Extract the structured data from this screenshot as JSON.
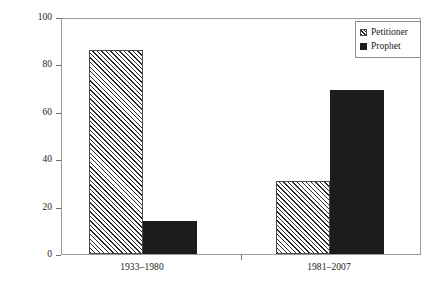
{
  "chart_data": {
    "type": "bar",
    "title": "",
    "subtitle": "",
    "xlabel": "",
    "ylabel": "Percentage of total linkages",
    "categories": [
      "1933–1980",
      "1981–2007"
    ],
    "series": [
      {
        "name": "Petitioner",
        "fill": "hatch",
        "color": "#2b2b2b",
        "values": [
          86,
          31
        ]
      },
      {
        "name": "Prophet",
        "fill": "solid",
        "color": "#1c1c1c",
        "values": [
          14,
          69
        ]
      }
    ],
    "ylim": [
      0,
      100
    ],
    "yticks": [
      0,
      20,
      40,
      60,
      80,
      100
    ],
    "ytick_labels": [
      "0",
      "20",
      "40",
      "60",
      "80",
      "100"
    ],
    "grid": false,
    "legend_position": "top-right",
    "frame": true
  },
  "legend": {
    "entries": [
      {
        "label": "Petitioner",
        "swatch": "hatched-square-swatch"
      },
      {
        "label": "Prophet",
        "swatch": "solid-square-swatch"
      }
    ]
  }
}
